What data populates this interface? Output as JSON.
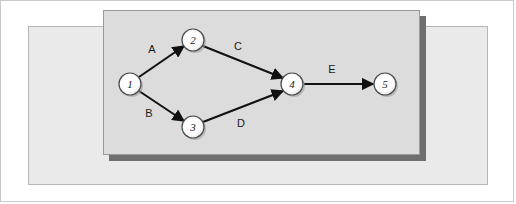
{
  "figure": {
    "kind": "activity-network-diagram"
  },
  "panels": {
    "back_panel_color": "#eaeaea",
    "front_panel_color": "#dcdcdc",
    "shadow_color": "#6f6f6f",
    "border_color": "#b6b6b6"
  },
  "graph": {
    "node_fill": "#ffffff",
    "node_stroke": "#4a4a4a",
    "edge_color": "#111111",
    "nodes": [
      {
        "id": "1",
        "label": "1",
        "cx": 130,
        "cy": 84,
        "r": 11
      },
      {
        "id": "2",
        "label": "2",
        "cx": 193,
        "cy": 40,
        "r": 11
      },
      {
        "id": "3",
        "label": "3",
        "cx": 193,
        "cy": 127,
        "r": 11
      },
      {
        "id": "4",
        "label": "4",
        "cx": 292,
        "cy": 84,
        "r": 11
      },
      {
        "id": "5",
        "label": "5",
        "cx": 385,
        "cy": 84,
        "r": 11
      }
    ],
    "edges": [
      {
        "id": "A",
        "label": "A",
        "from": "1",
        "to": "2",
        "label_x": 152,
        "label_y": 53
      },
      {
        "id": "B",
        "label": "B",
        "from": "1",
        "to": "3",
        "label_x": 149,
        "label_y": 117
      },
      {
        "id": "C",
        "label": "C",
        "from": "2",
        "to": "4",
        "label_x": 238,
        "label_y": 50
      },
      {
        "id": "D",
        "label": "D",
        "from": "3",
        "to": "4",
        "label_x": 241,
        "label_y": 127
      },
      {
        "id": "E",
        "label": "E",
        "from": "4",
        "to": "5",
        "label_x": 332,
        "label_y": 73
      }
    ]
  }
}
